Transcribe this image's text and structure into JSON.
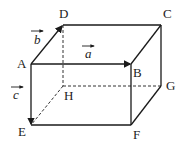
{
  "diagram": {
    "vertices": {
      "A": {
        "label": "A",
        "x": 31,
        "y": 64
      },
      "B": {
        "label": "B",
        "x": 131,
        "y": 64
      },
      "C": {
        "label": "C",
        "x": 161,
        "y": 25
      },
      "D": {
        "label": "D",
        "x": 63,
        "y": 25
      },
      "E": {
        "label": "E",
        "x": 31,
        "y": 125
      },
      "F": {
        "label": "F",
        "x": 131,
        "y": 125
      },
      "G": {
        "label": "G",
        "x": 161,
        "y": 86
      },
      "H": {
        "label": "H",
        "x": 63,
        "y": 86
      }
    },
    "vectors": {
      "a": {
        "label": "a",
        "from": "A",
        "to": "B"
      },
      "b": {
        "label": "b",
        "from": "A",
        "to": "D"
      },
      "c": {
        "label": "c",
        "from": "A",
        "to": "E"
      }
    },
    "hidden_edges": [
      "DH",
      "HE",
      "HG"
    ],
    "line_color": "#1a1a1a"
  }
}
